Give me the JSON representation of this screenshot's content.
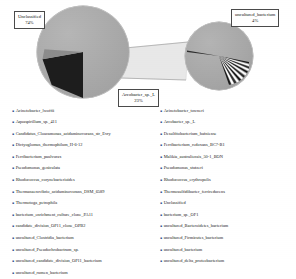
{
  "chart_data": {
    "type": "pie",
    "title": "",
    "subtitle": "",
    "variant": "pie-of-pie",
    "legend_position": "bottom",
    "labels_shown": [
      {
        "name": "Unclassified",
        "percent": "74%",
        "value": 74
      },
      {
        "name": "Arcobacter_sp._L",
        "percent": "23%",
        "value": 23
      },
      {
        "name": "uncultured_bacterium",
        "percent": "4%",
        "value": 4
      }
    ],
    "categories": [
      "Unclassified",
      "Arcobacter_sp._L",
      "uncultured_bacterium",
      "Acinetobacter_lwoffii",
      "Acinetobacter_towneri",
      "Aquaspirillum_sp._411",
      "Candidatus_Cloacamonas_acidaminovorans_str_Evry",
      "Desulfitobacterium_hafniense",
      "Dictyoglomus_thermophilum_H-6-12",
      "Ferribacterium_paulvorax",
      "Ferribacterium_redoxans_BC7-B1",
      "Malikia_australiensis_50-1_BON",
      "Pseudomonas_geniculata",
      "Pseudomonas_stutzeri",
      "Rhodococcus_corynebacterioides",
      "Rhodococcus_erythropolis",
      "Thermanaerovibrio_acidaminovorans_DSM_6589",
      "Thermosulfidibacter_ferrireducens",
      "Thermotoga_petrophila",
      "bacterium_enrichment_culture_clone_PA11",
      "bacterium_sp._OF1",
      "candidate_division_OP11_clone_OPB2",
      "uncultured_Bacteroidetes_bacterium",
      "uncultured_Clostridia_bacterium",
      "uncultured_Firmicutes_bacterium",
      "uncultured_Pseudochrobactrum_sp.",
      "uncultured_bacterium",
      "uncultured_candidate_division_OP11_bacterium",
      "uncultured_delta_proteobacterium",
      "uncultured_rumen_bacterium"
    ],
    "values": [
      74,
      23,
      4,
      0.3,
      0.3,
      0.3,
      0.3,
      0.3,
      0.3,
      0.3,
      0.3,
      0.3,
      0.3,
      0.3,
      0.3,
      0.3,
      0.3,
      0.3,
      0.3,
      0.3,
      0.3,
      0.3,
      0.3,
      0.3,
      0.3,
      0.3,
      0.3,
      0.3,
      0.3,
      0.3
    ],
    "xlabel": "",
    "ylabel": "",
    "grid": false
  },
  "callouts": [
    {
      "id": "unclassified",
      "name": "Unclassified",
      "percent": "74%"
    },
    {
      "id": "arcobacter",
      "name": "Arcobacter_sp._L",
      "percent": "23%"
    },
    {
      "id": "uncultured",
      "name": "uncultured_bacterium",
      "percent": "4%"
    }
  ],
  "legend": {
    "bullet": "▪",
    "left_column": [
      {
        "label": "Acinetobacter_lwoffii"
      },
      {
        "label": "Aquaspirillum_sp._411"
      },
      {
        "label": "Candidatus_Cloacamonas_acidaminovorans_str_Evry"
      },
      {
        "label": "Dictyoglomus_thermophilum_H-6-12"
      },
      {
        "label": "Ferribacterium_paulvorax"
      },
      {
        "label": "Pseudomonas_geniculata"
      },
      {
        "label": "Rhodococcus_corynebacterioides"
      },
      {
        "label": "Thermanaerovibrio_acidaminovorans_DSM_6589"
      },
      {
        "label": "Thermotoga_petrophila"
      },
      {
        "label": "bacterium_enrichment_culture_clone_PA11"
      },
      {
        "label": "candidate_division_OP11_clone_OPB2"
      },
      {
        "label": "uncultured_Clostridia_bacterium"
      },
      {
        "label": "uncultured_Pseudochrobactrum_sp."
      },
      {
        "label": "uncultured_candidate_division_OP11_bacterium"
      },
      {
        "label": "uncultured_rumen_bacterium"
      }
    ],
    "right_column": [
      {
        "label": "Acinetobacter_towneri"
      },
      {
        "label": "Arcobacter_sp._L"
      },
      {
        "label": "Desulfitobacterium_hafniense"
      },
      {
        "label": "Ferribacterium_redoxans_BC7-B1"
      },
      {
        "label": "Malikia_australiensis_50-1_BON"
      },
      {
        "label": "Pseudomonas_stutzeri"
      },
      {
        "label": "Rhodococcus_erythropolis"
      },
      {
        "label": "Thermosulfidibacter_ferrireducens"
      },
      {
        "label": "Unclassified"
      },
      {
        "label": "bacterium_sp._OF1"
      },
      {
        "label": "uncultured_Bacteroidetes_bacterium"
      },
      {
        "label": "uncultured_Firmicutes_bacterium"
      },
      {
        "label": "uncultured_bacterium"
      },
      {
        "label": "uncultured_delta_proteobacterium"
      }
    ]
  },
  "colors": {
    "main_slice": "#a9a9a9",
    "dark_slice": "#1d1d1d",
    "secondary_slice": "#a8a8a8",
    "callout_border": "#4a4a4a",
    "bullet": "#2b4a8b",
    "background": "#ffffff"
  }
}
